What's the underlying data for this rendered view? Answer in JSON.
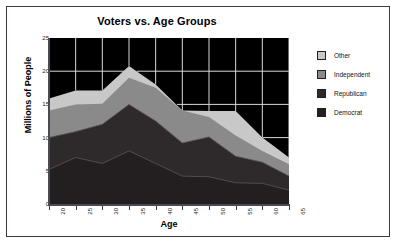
{
  "chart_data": {
    "type": "area",
    "stacked": true,
    "title": "Voters vs. Age Groups",
    "xlabel": "Age",
    "ylabel": "Millions of People",
    "categories": [
      20,
      25,
      30,
      35,
      40,
      45,
      50,
      55,
      60,
      65
    ],
    "x": [
      20,
      25,
      30,
      35,
      40,
      45,
      50,
      55,
      60,
      65
    ],
    "xtick_labels": [
      "20",
      "25",
      "30",
      "35",
      "40",
      "45",
      "50",
      "55",
      "60",
      "65"
    ],
    "ytick_labels": [
      "0",
      "5",
      "10",
      "15",
      "20",
      "25"
    ],
    "yticks": [
      0,
      5,
      10,
      15,
      20,
      25
    ],
    "ylim": [
      0,
      25
    ],
    "xlim": [
      20,
      65
    ],
    "grid": true,
    "grid_color": "#d8d8d8",
    "plot_background": "#000000",
    "legend_position": "right",
    "series": [
      {
        "name": "Democrat",
        "color": "#231f20",
        "order": 1,
        "values": [
          5.2,
          7.0,
          6.1,
          8.0,
          6.1,
          4.2,
          4.1,
          3.2,
          3.1,
          2.1
        ]
      },
      {
        "name": "Republican",
        "color": "#2e2a2b",
        "order": 2,
        "values": [
          4.8,
          3.9,
          5.9,
          7.0,
          6.4,
          5.0,
          6.0,
          4.0,
          3.2,
          2.1
        ]
      },
      {
        "name": "Independent",
        "color": "#8a8a8a",
        "order": 3,
        "values": [
          4.1,
          4.1,
          3.1,
          4.0,
          5.0,
          4.9,
          3.0,
          3.1,
          1.7,
          1.8
        ]
      },
      {
        "name": "Other",
        "color": "#c8c8c8",
        "order": 4,
        "values": [
          1.8,
          2.1,
          2.0,
          1.8,
          0.5,
          0.0,
          0.9,
          3.7,
          2.0,
          1.0
        ]
      }
    ],
    "cumulative_tops": {
      "democrat": [
        5.2,
        7.0,
        6.1,
        8.0,
        6.1,
        4.2,
        4.1,
        3.2,
        3.1,
        2.1
      ],
      "republican": [
        10.0,
        10.9,
        12.0,
        15.0,
        12.5,
        9.2,
        10.1,
        7.2,
        6.3,
        4.2
      ],
      "independent": [
        14.1,
        15.0,
        15.1,
        19.0,
        17.5,
        14.1,
        13.1,
        10.3,
        8.0,
        6.0
      ],
      "other": [
        15.9,
        17.1,
        17.1,
        20.8,
        18.0,
        14.1,
        14.0,
        14.0,
        10.0,
        7.0
      ]
    }
  },
  "legend": {
    "entries": [
      {
        "label": "Other",
        "color": "#c8c8c8"
      },
      {
        "label": "Independent",
        "color": "#8a8a8a"
      },
      {
        "label": "Republican",
        "color": "#2e2a2b"
      },
      {
        "label": "Democrat",
        "color": "#231f20"
      }
    ]
  }
}
